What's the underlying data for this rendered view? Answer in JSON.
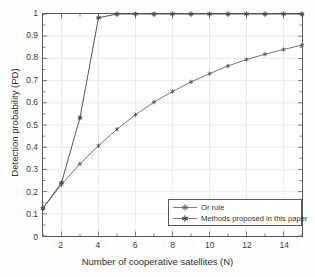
{
  "chart_data": {
    "type": "line",
    "title": "",
    "xlabel": "Number of cooperative satellites (N)",
    "ylabel": "Detection probability (PD)",
    "xlim": [
      1,
      15
    ],
    "ylim": [
      0,
      1
    ],
    "xticks": [
      2,
      4,
      6,
      8,
      10,
      12,
      14
    ],
    "xtick_labels": [
      "2",
      "4",
      "6",
      "8",
      "10",
      "12",
      "14"
    ],
    "yticks": [
      0,
      0.1,
      0.2,
      0.3,
      0.4,
      0.5,
      0.6,
      0.7,
      0.8,
      0.9,
      1
    ],
    "ytick_labels": [
      "0",
      "0.1",
      "0.2",
      "0.3",
      "0.4",
      "0.5",
      "0.6",
      "0.7",
      "0.8",
      "0.9",
      "1"
    ],
    "grid": true,
    "legend_position": "lower right",
    "x": [
      1,
      2,
      3,
      4,
      5,
      6,
      7,
      8,
      9,
      10,
      11,
      12,
      13,
      14,
      15
    ],
    "series": [
      {
        "name": "Or rule",
        "marker": "asterisk",
        "color": "#5a5a5a",
        "values": [
          0.125,
          0.232,
          0.325,
          0.407,
          0.481,
          0.546,
          0.603,
          0.651,
          0.694,
          0.731,
          0.766,
          0.795,
          0.819,
          0.84,
          0.86
        ]
      },
      {
        "name": "Methods proposed in this paper",
        "marker": "asterisk",
        "color": "#4a4a4a",
        "values": [
          0.125,
          0.24,
          0.533,
          0.983,
          1.0,
          1.0,
          1.0,
          1.0,
          1.0,
          1.0,
          1.0,
          1.0,
          1.0,
          1.0,
          1.0
        ]
      }
    ]
  },
  "legend": {
    "items": [
      {
        "label": "Or rule"
      },
      {
        "label": "Methods proposed in this paper"
      }
    ]
  },
  "colors": {
    "axis": "#5a5a5a",
    "grid": "#e2e2e2",
    "line": "#5a5a5a",
    "background": "#ffffff",
    "text": "#2f2f2f"
  }
}
